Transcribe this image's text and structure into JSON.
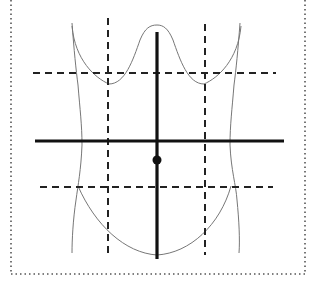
{
  "diagram": {
    "elements": [
      {
        "name": "torso-outline",
        "kind": "thin curved outline"
      },
      {
        "name": "midline-vertical-axis",
        "kind": "solid thick line"
      },
      {
        "name": "transumbilical-horizontal-axis",
        "kind": "solid thick line"
      },
      {
        "name": "umbilicus-dot",
        "kind": "filled dot"
      },
      {
        "name": "left-midclavicular-line",
        "kind": "dashed vertical line"
      },
      {
        "name": "right-midclavicular-line",
        "kind": "dashed vertical line"
      },
      {
        "name": "subcostal-plane",
        "kind": "dashed horizontal line"
      },
      {
        "name": "intertubercular-plane",
        "kind": "dashed horizontal line"
      }
    ],
    "colors": {
      "line": "#111111",
      "outline": "#777777",
      "border": "#555555",
      "background": "#ffffff"
    }
  }
}
